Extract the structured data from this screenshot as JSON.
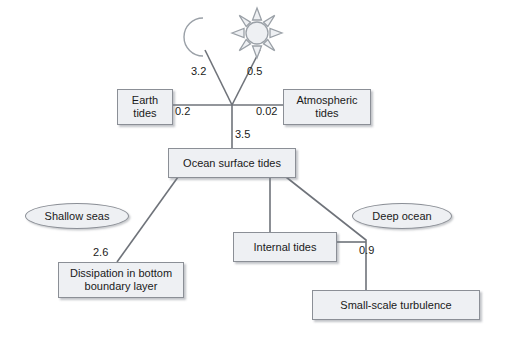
{
  "diagram": {
    "colors": {
      "node_fill": "#eef0f3",
      "node_stroke": "#8b8f96",
      "edge_stroke": "#6f737a",
      "text": "#1a1a1a",
      "background": "#ffffff"
    },
    "icons": [
      {
        "id": "moon",
        "name": "moon-icon",
        "label": "Moon"
      },
      {
        "id": "sun",
        "name": "sun-icon",
        "label": "Sun"
      }
    ],
    "nodes": [
      {
        "id": "earth_tides",
        "shape": "box",
        "label": "Earth\ntides"
      },
      {
        "id": "atmospheric_tides",
        "shape": "box",
        "label": "Atmospheric\ntides"
      },
      {
        "id": "ocean_surface_tides",
        "shape": "box",
        "label": "Ocean surface tides"
      },
      {
        "id": "dissipation_bbl",
        "shape": "box",
        "label": "Dissipation in bottom\nboundary layer"
      },
      {
        "id": "internal_tides",
        "shape": "box",
        "label": "Internal tides"
      },
      {
        "id": "small_scale_turbulence",
        "shape": "box",
        "label": "Small-scale turbulence"
      },
      {
        "id": "shallow_seas",
        "shape": "ellipse",
        "label": "Shallow seas"
      },
      {
        "id": "deep_ocean",
        "shape": "ellipse",
        "label": "Deep ocean"
      }
    ],
    "node_labels": {
      "earth_tides_line1": "Earth",
      "earth_tides_line2": "tides",
      "atmospheric_tides_line1": "Atmospheric",
      "atmospheric_tides_line2": "tides",
      "ocean_surface_tides": "Ocean surface tides",
      "dissipation_line1": "Dissipation in bottom",
      "dissipation_line2": "boundary layer",
      "internal_tides": "Internal tides",
      "small_scale_turbulence": "Small-scale turbulence",
      "shallow_seas": "Shallow seas",
      "deep_ocean": "Deep ocean"
    },
    "edges": [
      {
        "id": "moon_to_hub",
        "from": "moon",
        "to": "hub",
        "value": "3.2"
      },
      {
        "id": "sun_to_hub",
        "from": "sun",
        "to": "hub",
        "value": "0.5"
      },
      {
        "id": "hub_to_earth_tides",
        "from": "hub",
        "to": "earth_tides",
        "value": "0.2"
      },
      {
        "id": "hub_to_atmospheric_tides",
        "from": "hub",
        "to": "atmospheric_tides",
        "value": "0.02"
      },
      {
        "id": "hub_to_ocean_surface_tides",
        "from": "hub",
        "to": "ocean_surface_tides",
        "value": "3.5"
      },
      {
        "id": "ocean_to_dissipation",
        "from": "ocean_surface_tides",
        "to": "dissipation_bbl",
        "value": "2.6"
      },
      {
        "id": "ocean_to_internal_tides",
        "from": "ocean_surface_tides",
        "to": "internal_tides",
        "value": ""
      },
      {
        "id": "ocean_to_turbulence",
        "from": "ocean_surface_tides",
        "to": "small_scale_turbulence",
        "value": "0.9"
      },
      {
        "id": "internal_tides_to_turbulence",
        "from": "internal_tides",
        "to": "small_scale_turbulence",
        "value": ""
      }
    ],
    "edge_labels": {
      "moon_value": "3.2",
      "sun_value": "0.5",
      "earth_value": "0.2",
      "atmospheric_value": "0.02",
      "ocean_value": "3.5",
      "dissipation_value": "2.6",
      "turbulence_value": "0.9"
    }
  }
}
